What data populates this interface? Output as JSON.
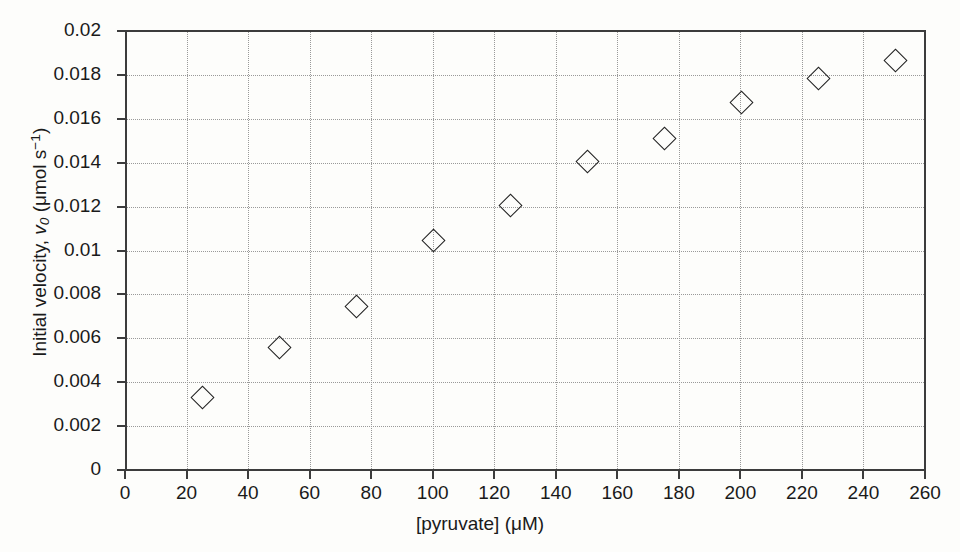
{
  "chart_data": {
    "type": "scatter",
    "title": "",
    "xlabel": "[pyruvate] (μM)",
    "ylabel": "Initial velocity, v0 (μmol s⁻¹)",
    "ylabel_parts": {
      "prefix": "Initial velocity, ",
      "symbol": "v",
      "subscript": "0",
      "units_open": " (μmol s",
      "superscript": "−1",
      "units_close": ")"
    },
    "xlim": [
      0,
      260
    ],
    "ylim": [
      0,
      0.02
    ],
    "xticks": [
      0,
      20,
      40,
      60,
      80,
      100,
      120,
      140,
      160,
      180,
      200,
      220,
      240,
      260
    ],
    "xticklabels": [
      "0",
      "20",
      "40",
      "60",
      "80",
      "100",
      "120",
      "140",
      "160",
      "180",
      "200",
      "220",
      "240",
      "260"
    ],
    "yticks": [
      0,
      0.002,
      0.004,
      0.006,
      0.008,
      0.01,
      0.012,
      0.014,
      0.016,
      0.018,
      0.02
    ],
    "yticklabels": [
      "0",
      "0.002",
      "0.004",
      "0.006",
      "0.008",
      "0.01",
      "0.012",
      "0.014",
      "0.016",
      "0.018",
      "0.02"
    ],
    "grid": true,
    "grid_style": "dotted",
    "grid_color": "#999999",
    "legend": null,
    "marker": "open-diamond",
    "marker_color": "#222222",
    "x": [
      25,
      50,
      75,
      100,
      125,
      150,
      175,
      200,
      225,
      250
    ],
    "y": [
      0.00333,
      0.00562,
      0.00748,
      0.01048,
      0.01208,
      0.01408,
      0.01515,
      0.01678,
      0.01787,
      0.01868
    ],
    "points": [
      {
        "x": 25,
        "y": 0.00333
      },
      {
        "x": 50,
        "y": 0.00562
      },
      {
        "x": 75,
        "y": 0.00748
      },
      {
        "x": 100,
        "y": 0.01048
      },
      {
        "x": 125,
        "y": 0.01208
      },
      {
        "x": 150,
        "y": 0.01408
      },
      {
        "x": 175,
        "y": 0.01515
      },
      {
        "x": 200,
        "y": 0.01678
      },
      {
        "x": 225,
        "y": 0.01787
      },
      {
        "x": 250,
        "y": 0.01868
      }
    ]
  }
}
